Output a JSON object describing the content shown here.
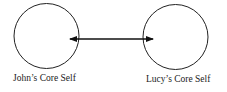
{
  "diagram": {
    "nodes": [
      {
        "id": "john",
        "label": "John’s Core Self"
      },
      {
        "id": "lucy",
        "label": "Lucy’s Core Self"
      }
    ],
    "edges": [
      {
        "from": "john",
        "to": "lucy",
        "type": "bidirectional-arrow"
      }
    ]
  }
}
